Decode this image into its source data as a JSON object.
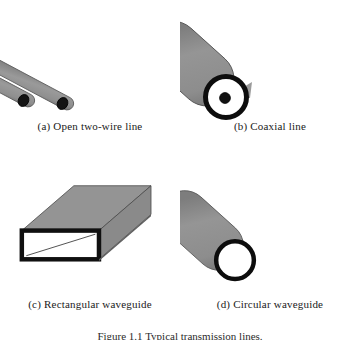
{
  "figure": {
    "caption": "Figure 1.1  Typical transmission lines.",
    "panels": [
      {
        "id": "a",
        "label": "(a)  Open two-wire line",
        "art": "two-parallel-wires"
      },
      {
        "id": "b",
        "label": "(b)  Coaxial line",
        "art": "coaxial-cylinder-with-inner-conductor"
      },
      {
        "id": "c",
        "label": "(c)  Rectangular waveguide",
        "art": "hollow-rectangular-tube"
      },
      {
        "id": "d",
        "label": "(d)  Circular waveguide",
        "art": "hollow-circular-tube"
      }
    ]
  },
  "colors": {
    "metal_gray": "#8c8c8c",
    "metal_gray_dark": "#7a7a7a",
    "outline": "#1a1a1a",
    "interior_white": "#ffffff",
    "page_background": "#ffffff"
  }
}
